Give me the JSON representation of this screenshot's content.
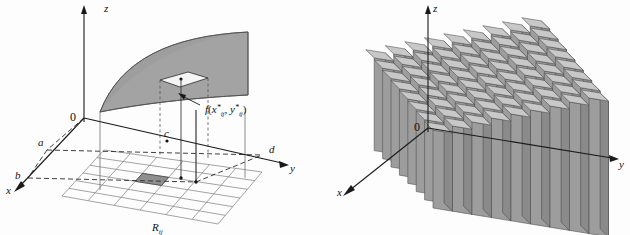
{
  "figure": {
    "background_color": "#fdfdfd",
    "width": 630,
    "height": 235
  },
  "colors": {
    "surface_fill": "#9a9a9a",
    "surface_fill_light": "#b5b5b5",
    "surface_edge": "#5a5a5a",
    "axis": "#1a1a1a",
    "grid": "#7d7d7d",
    "dashed": "#2b2b2b",
    "box_top": "#c8c8c8",
    "box_front": "#9d9d9d",
    "box_side": "#8a8a8a",
    "box_edge": "#4a4a4a",
    "patch_fill": "#f2f2f2",
    "cell_fill": "#8f8f8f",
    "text": "#111111"
  },
  "left_panel": {
    "name": "surface-with-sample-point",
    "axes": [
      {
        "id": "z",
        "label": "z",
        "x": 104,
        "y": 10
      },
      {
        "id": "y",
        "label": "y",
        "x": 290,
        "y": 167
      },
      {
        "id": "x",
        "label": "x",
        "x": 7,
        "y": 190
      }
    ],
    "origin_label": "0",
    "origin_x": 84,
    "origin_y": 118,
    "bounds": [
      {
        "id": "a",
        "label": "a",
        "x": 40,
        "y": 143
      },
      {
        "id": "b",
        "label": "b",
        "x": 18,
        "y": 176
      },
      {
        "id": "c",
        "label": "c",
        "x": 167,
        "y": 134
      },
      {
        "id": "d",
        "label": "d",
        "x": 272,
        "y": 150
      }
    ],
    "annotations": [
      {
        "id": "f-sample-value",
        "text": "f(x*ij, y*ij)",
        "rendered": "f(x∗ij, y∗ij)",
        "x": 208,
        "y": 110
      },
      {
        "id": "subrectangle",
        "text": "Rij",
        "x": 160,
        "y": 228
      }
    ],
    "grid": {
      "rows": 6,
      "cols": 6
    },
    "highlighted_cell": {
      "row": 3,
      "col": 3
    }
  },
  "right_panel": {
    "name": "riemann-sum-boxes",
    "axes": [
      {
        "id": "z",
        "label": "z",
        "x": 424,
        "y": 10
      },
      {
        "id": "y",
        "label": "y",
        "x": 619,
        "y": 168
      },
      {
        "id": "x",
        "label": "x",
        "x": 341,
        "y": 194
      }
    ],
    "origin_label": "0",
    "origin_x": 428,
    "origin_y": 128,
    "columns": {
      "rows": 8,
      "cols": 9
    },
    "description": "staircase of rectangular boxes approximating the volume under the surface"
  }
}
